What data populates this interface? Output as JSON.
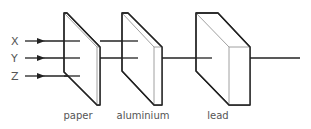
{
  "diagram": {
    "type": "radiation-penetration",
    "rays": [
      {
        "label": "X",
        "y": 41
      },
      {
        "label": "Y",
        "y": 58
      },
      {
        "label": "Z",
        "y": 76
      }
    ],
    "absorbers": [
      {
        "label": "paper"
      },
      {
        "label": "aluminium"
      },
      {
        "label": "lead"
      }
    ],
    "colors": {
      "line": "#222222",
      "text": "#555555",
      "face_edge": "#999999"
    }
  }
}
